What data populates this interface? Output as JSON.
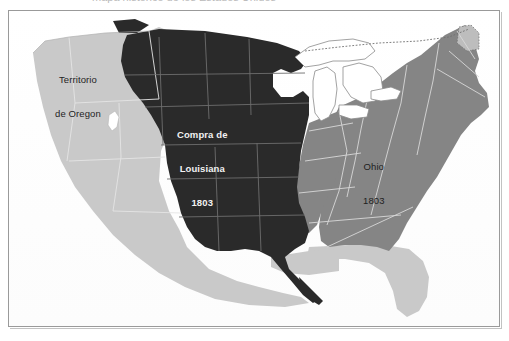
{
  "page": {
    "caption_sliver": "mapa histórico de los Estados Unidos"
  },
  "map": {
    "title": "Mapa de la Compra de Luisiana 1803",
    "frame_border_color": "#9a9a9a",
    "background_color": "#ffffff",
    "labels": [
      {
        "id": "territorio-de-oregon",
        "line1": "Territorio",
        "line2": "de Oregon",
        "text_color": "#242424",
        "region_color": "#c9c9c9"
      },
      {
        "id": "compra-de-louisiana",
        "line1": "Compra de",
        "line2": "Louisiana",
        "line3": "1803",
        "text_color": "#f2f2f2",
        "region_color": "#2a2a2a"
      },
      {
        "id": "ohio",
        "line1": "Ohio",
        "line2": "1803",
        "text_color": "#1e1e1e",
        "region_color": "#858585"
      }
    ],
    "legend_colors": {
      "louisiana_purchase": "#2a2a2a",
      "existing_states": "#858585",
      "unorganized_territory": "#c9c9c9",
      "great_lakes": "#ffffff",
      "state_border": "#e8e8e8",
      "coast_outline": "#7d7d7d"
    },
    "regions": [
      {
        "name": "Louisiana Purchase 1803",
        "shade": "dark"
      },
      {
        "name": "Ohio 1803",
        "shade": "medium"
      },
      {
        "name": "Original Eastern States",
        "shade": "medium"
      },
      {
        "name": "Territorio de Oregon",
        "shade": "light"
      },
      {
        "name": "Spanish Territory (Southwest)",
        "shade": "light"
      },
      {
        "name": "Spanish Florida",
        "shade": "light"
      },
      {
        "name": "Great Lakes",
        "shade": "white"
      }
    ]
  }
}
